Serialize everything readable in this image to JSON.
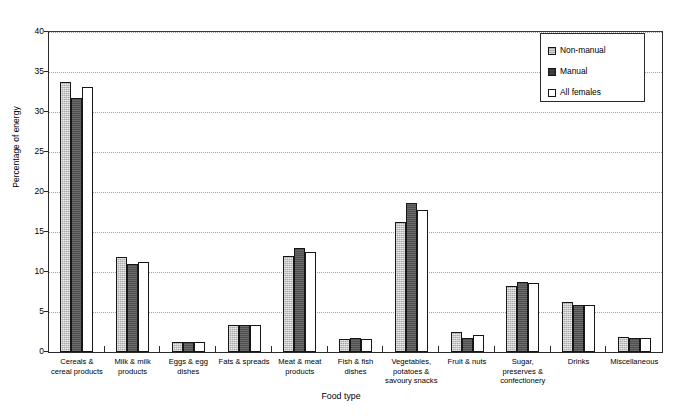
{
  "chart_data": {
    "type": "bar",
    "title": "",
    "xlabel": "Food type",
    "ylabel": "Percentage of energy",
    "ylim": [
      0,
      40
    ],
    "ytick_step": 5,
    "yticks": [
      0,
      5,
      10,
      15,
      20,
      25,
      30,
      35,
      40
    ],
    "grid": "horizontal-dotted",
    "legend_position": "top-right",
    "categories": [
      "Cereals & cereal products",
      "Milk & milk products",
      "Eggs & egg dishes",
      "Fats & spreads",
      "Meat & meat products",
      "Fish & fish dishes",
      "Vegetables, potatoes & savoury snacks",
      "Fruit & nuts",
      "Sugar, preserves & confectionery",
      "Drinks",
      "Miscellaneous"
    ],
    "series": [
      {
        "name": "Non-manual",
        "color": "#a9a9a9",
        "values": [
          33.8,
          11.9,
          1.3,
          3.4,
          12.0,
          1.6,
          16.3,
          2.5,
          8.3,
          6.3,
          1.9
        ]
      },
      {
        "name": "Manual",
        "color": "#4f4f4f",
        "values": [
          31.7,
          11.0,
          1.3,
          3.4,
          13.0,
          1.7,
          18.6,
          1.7,
          8.7,
          5.9,
          1.8
        ]
      },
      {
        "name": "All females",
        "color": "#ffffff",
        "values": [
          33.1,
          11.3,
          1.3,
          3.4,
          12.5,
          1.6,
          17.8,
          2.1,
          8.6,
          5.9,
          1.8
        ]
      }
    ]
  },
  "axis": {
    "y_labels": [
      "40",
      "35",
      "30",
      "25",
      "20",
      "15",
      "10",
      "5",
      "0"
    ],
    "y_title": "Percentage of energy",
    "x_title": "Food type"
  },
  "x_labels": [
    "Cereals &\ncereal products",
    "Milk & milk\nproducts",
    "Eggs & egg\ndishes",
    "Fats & spreads",
    "Meat & meat\nproducts",
    "Fish & fish\ndishes",
    "Vegetables,\npotatoes &\nsavoury snacks",
    "Fruit & nuts",
    "Sugar,\npreserves &\nconfectionery",
    "Drinks",
    "Miscellaneous"
  ],
  "legend": {
    "items": [
      {
        "label": "Non-manual"
      },
      {
        "label": "Manual"
      },
      {
        "label": "All females"
      }
    ]
  }
}
